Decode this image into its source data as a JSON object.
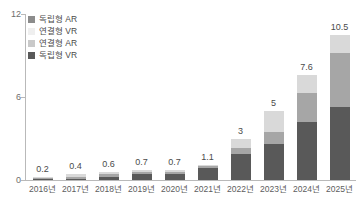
{
  "chart_data": {
    "type": "bar",
    "subtype": "stacked-bar",
    "title": "",
    "xlabel": "",
    "ylabel": "",
    "ylim": [
      0,
      12
    ],
    "yticks": [
      0,
      6,
      12
    ],
    "grid": false,
    "legend_position": "top-left",
    "categories": [
      "2016년",
      "2017년",
      "2018년",
      "2019년",
      "2020년",
      "2021년",
      "2022년",
      "2023년",
      "2024년",
      "2025년"
    ],
    "totals": [
      "0.2",
      "0.4",
      "0.6",
      "0.7",
      "0.7",
      "1.1",
      "3",
      "5",
      "7.6",
      "10.5"
    ],
    "series": [
      {
        "name": "독립형 VR",
        "color": "#595959",
        "values": [
          0.05,
          0.1,
          0.25,
          0.4,
          0.45,
          0.85,
          1.9,
          2.6,
          4.2,
          5.3
        ]
      },
      {
        "name": "연결형 AR",
        "color": "#a6a6a6",
        "values": [
          0.05,
          0.1,
          0.2,
          0.15,
          0.15,
          0.15,
          0.4,
          0.9,
          2.1,
          3.9
        ]
      },
      {
        "name": "연결형 VR",
        "color": "#d9d9d9",
        "values": [
          0.1,
          0.2,
          0.15,
          0.15,
          0.1,
          0.1,
          0.7,
          1.5,
          1.3,
          1.3
        ]
      },
      {
        "name": "독립형 AR",
        "color": "#efefef",
        "values": [
          0,
          0,
          0,
          0,
          0,
          0,
          0,
          0,
          0,
          0
        ]
      }
    ],
    "legend": [
      {
        "label": "독립형 AR",
        "color": "#8c8c8c"
      },
      {
        "label": "연결형 VR",
        "color": "#efefef"
      },
      {
        "label": "연결형 AR",
        "color": "#c9c9c9"
      },
      {
        "label": "독립형 VR",
        "color": "#595959"
      }
    ]
  }
}
